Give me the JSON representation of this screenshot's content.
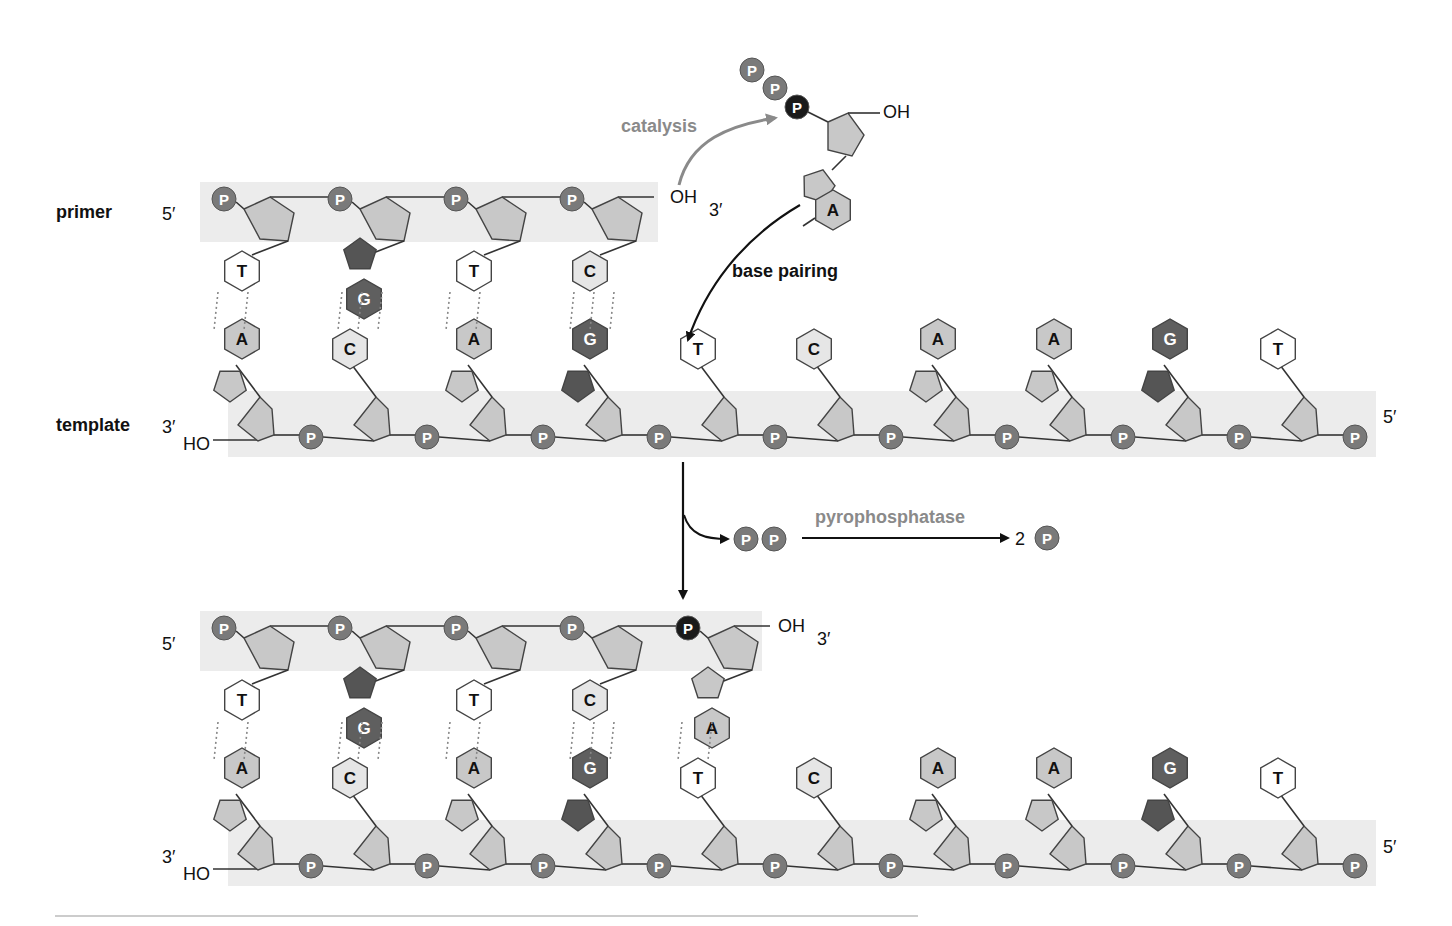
{
  "labels": {
    "primer": "primer",
    "template": "template",
    "five_prime": "5′",
    "three_prime": "3′",
    "oh": "OH",
    "ho": "HO",
    "catalysis": "catalysis",
    "base_pairing": "base pairing",
    "pyrophosphatase": "pyrophosphatase",
    "two": "2",
    "phosphate": "P"
  },
  "colors": {
    "phosphate": "#7a7a7a",
    "new_phosphate": "#1a1a1a",
    "sugar": "#c8c8c8",
    "band": "#ececec",
    "A": "#c8c8c8",
    "G": "#5f5f5f",
    "C": "#e6e6e6",
    "T": "#ffffff",
    "catalysis_arrow": "#8a8a8a"
  },
  "top_panel": {
    "primer_bases": [
      "T",
      "G",
      "T",
      "C"
    ],
    "template_bases": [
      "A",
      "C",
      "A",
      "G",
      "T",
      "C",
      "A",
      "A",
      "G",
      "T"
    ],
    "incoming_nucleotide": {
      "base": "A",
      "phosphates": 3
    }
  },
  "bottom_panel": {
    "primer_bases": [
      "T",
      "G",
      "T",
      "C",
      "A"
    ],
    "template_bases": [
      "A",
      "C",
      "A",
      "G",
      "T",
      "C",
      "A",
      "A",
      "G",
      "T"
    ]
  },
  "side_products": {
    "pyrophosphate": "PP",
    "result": "2 P"
  }
}
